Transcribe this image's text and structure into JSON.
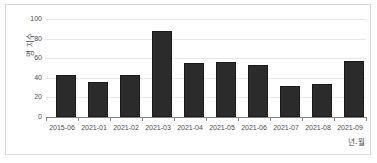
{
  "chart_data": {
    "type": "bar",
    "title": "",
    "subtitle": "",
    "xlabel": "년-월",
    "ylabel": "명 지수",
    "categories": [
      "2015-06",
      "2021-01",
      "2021-02",
      "2021-03",
      "2021-04",
      "2021-05",
      "2021-06",
      "2021-07",
      "2021-08",
      "2021-09"
    ],
    "values": [
      43,
      36,
      43,
      88,
      55,
      56,
      53,
      32,
      34,
      57
    ],
    "ylim": [
      0,
      100
    ],
    "ytick_labels": [
      "0",
      "20",
      "40",
      "60",
      "80",
      "100"
    ],
    "ytick_values": [
      0,
      20,
      40,
      60,
      80,
      100
    ],
    "grid": true,
    "grid_axis": "y",
    "legend": false,
    "legend_position": "none",
    "bar_color": "#2b2b2b",
    "grid_color": "#e8e8e8",
    "axis_color": "#7f7f7f",
    "frame_color": "#d9d9d9",
    "text_color": "#4d4d4d"
  }
}
